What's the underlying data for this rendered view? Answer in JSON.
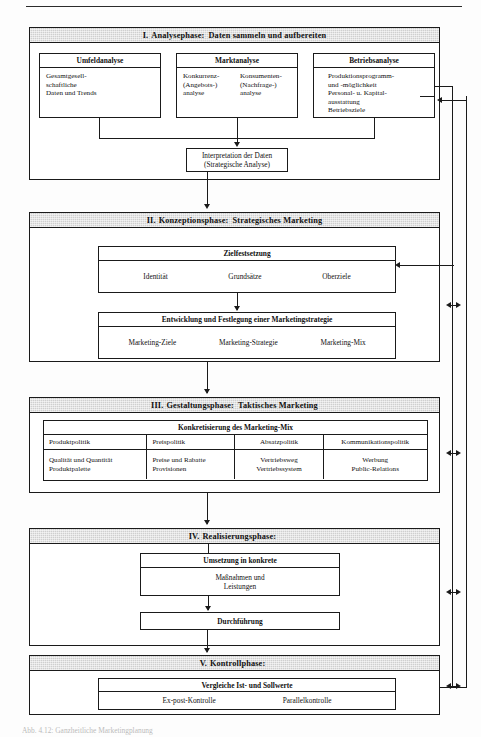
{
  "document": {
    "caption": "Abb. 4.12: Ganzheitliche Marketingplanung",
    "colors": {
      "header_band": "#cfcfcf",
      "line": "#1a1a1a",
      "page_background": "#fdfdfd"
    }
  },
  "phases": {
    "analyse": {
      "numeral": "I.",
      "name": "Analysephase",
      "colon": ":",
      "subtitle": "Daten sammeln und aufbereiten",
      "boxes": {
        "umfeldanalyse": {
          "title": "Umfeldanalyse",
          "lines": [
            "Gesamtgesell-",
            "schaftliche",
            "Daten und Trends"
          ]
        },
        "marktanalyse": {
          "title": "Marktanalyse",
          "left_lines": [
            "Konkurrenz-",
            "(Angebots-)",
            "analyse"
          ],
          "right_lines": [
            "Konsumenten-",
            "(Nachfrage-)",
            "analyse"
          ]
        },
        "betriebsanalyse": {
          "title": "Betriebsanalyse",
          "lines": [
            "Produktionsprogramm-",
            "und -möglichkeit",
            "Personal- u. Kapital-",
            "ausstattung",
            "Betriebsziele"
          ]
        },
        "interpretation": {
          "line1": "Interpretation der Daten",
          "line2": "(Strategische Analyse)"
        }
      }
    },
    "konzeption": {
      "numeral": "II.",
      "name": "Konzeptionsphase",
      "colon": ":",
      "subtitle": "Strategisches Marketing",
      "boxes": {
        "zielfestsetzung": {
          "title": "Zielfestsetzung",
          "items": [
            "Identität",
            "Grundsätze",
            "Oberziele"
          ]
        },
        "strategie": {
          "title": "Entwicklung und Festlegung einer Marketingstrategie",
          "items": [
            "Marketing-Ziele",
            "Marketing-Strategie",
            "Marketing-Mix"
          ]
        }
      }
    },
    "gestaltung": {
      "numeral": "III.",
      "name": "Gestaltungsphase",
      "colon": ":",
      "subtitle": "Taktisches Marketing",
      "table": {
        "caption": "Konkretisierung des Marketing-Mix",
        "headers": [
          "Produktpolitik",
          "Preispolitik",
          "Absatzpolitik",
          "Kommunikationspolitik"
        ],
        "cells": [
          [
            "Qualität und Quantität",
            "Produktpalette"
          ],
          [
            "Preise und Rabatte",
            "Provisionen"
          ],
          [
            "Vertriebsweg",
            "Vertriebssystem"
          ],
          [
            "Werbung",
            "Public-Relations"
          ]
        ]
      }
    },
    "realisierung": {
      "numeral": "IV.",
      "name": "Realisierungsphase",
      "colon": ":",
      "subtitle": "",
      "boxes": {
        "umsetzung": {
          "title": "Umsetzung in konkrete",
          "lines": [
            "Maßnahmen und",
            "Leistungen"
          ]
        },
        "durchfuehrung": {
          "title": "Durchführung"
        }
      }
    },
    "kontrolle": {
      "numeral": "V.",
      "name": "Kontrollphase",
      "colon": ":",
      "subtitle": "",
      "boxes": {
        "vergleiche": {
          "title": "Vergleiche  Ist- und Sollwerte",
          "items": [
            "Ex-post-Kontrolle",
            "Parallelkontrolle"
          ]
        }
      }
    }
  }
}
